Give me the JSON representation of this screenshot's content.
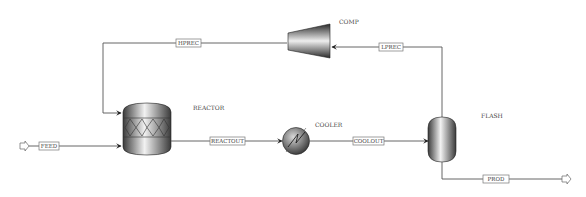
{
  "diagram": {
    "type": "process-flowsheet",
    "blocks": [
      {
        "id": "REACTOR",
        "label": "REACTOR",
        "kind": "reactor"
      },
      {
        "id": "COOLER",
        "label": "COOLER",
        "kind": "heat-exchanger"
      },
      {
        "id": "FLASH",
        "label": "FLASH",
        "kind": "flash-drum"
      },
      {
        "id": "COMP",
        "label": "COMP",
        "kind": "compressor"
      }
    ],
    "streams": [
      {
        "id": "FEED",
        "label": "FEED",
        "from": "",
        "to": "REACTOR"
      },
      {
        "id": "REACTOUT",
        "label": "REACTOUT",
        "from": "REACTOR",
        "to": "COOLER"
      },
      {
        "id": "COOLOUT",
        "label": "COOLOUT",
        "from": "COOLER",
        "to": "FLASH"
      },
      {
        "id": "LPREC",
        "label": "LPREC",
        "from": "FLASH",
        "to": "COMP"
      },
      {
        "id": "HPREC",
        "label": "HPREC",
        "from": "COMP",
        "to": "REACTOR"
      },
      {
        "id": "PROD",
        "label": "PROD",
        "from": "FLASH",
        "to": ""
      }
    ]
  },
  "labels": {
    "reactor": "REACTOR",
    "cooler": "COOLER",
    "flash": "FLASH",
    "comp": "COMP",
    "feed": "FEED",
    "reactout": "REACTOUT",
    "coolout": "COOLOUT",
    "lprec": "LPREC",
    "hprec": "HPREC",
    "prod": "PROD"
  }
}
